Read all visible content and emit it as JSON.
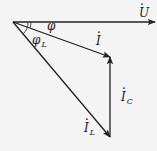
{
  "diagram": {
    "type": "phasor-diagram",
    "colors": {
      "background": "#f4f4f4",
      "stroke": "#222222"
    },
    "origin": {
      "x": 13,
      "y": 22
    },
    "phasors": [
      {
        "id": "U",
        "symbol": "U",
        "subscript": "",
        "from": [
          13,
          22
        ],
        "to": [
          155,
          22
        ]
      },
      {
        "id": "I",
        "symbol": "I",
        "subscript": "",
        "from": [
          13,
          22
        ],
        "to": [
          110,
          57
        ]
      },
      {
        "id": "I_C",
        "symbol": "I",
        "subscript": "C",
        "from": [
          110,
          137
        ],
        "to": [
          110,
          56
        ]
      },
      {
        "id": "I_L",
        "symbol": "I",
        "subscript": "L",
        "from": [
          13,
          22
        ],
        "to": [
          110,
          138
        ]
      }
    ],
    "angles": [
      {
        "id": "phi",
        "symbol": "φ",
        "subscript": ""
      },
      {
        "id": "phi_L",
        "symbol": "φ",
        "subscript": "L"
      }
    ],
    "labels": {
      "U": "U",
      "I": "I",
      "I_C": "I",
      "I_C_sub": "C",
      "I_L": "I",
      "I_L_sub": "L",
      "phi": "φ",
      "phi_L": "φ",
      "phi_L_sub": "L"
    }
  }
}
